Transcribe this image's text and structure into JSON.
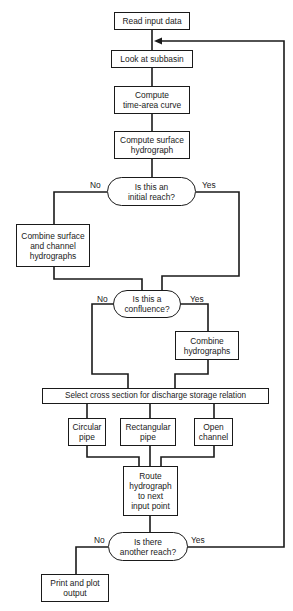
{
  "diagram": {
    "nodes": {
      "read_input": {
        "label": "Read input data"
      },
      "look_subbasin": {
        "label": "Look at subbasin"
      },
      "time_area": {
        "label": "Compute\ntime-area curve"
      },
      "surface_hydro": {
        "label": "Compute surface\nhydrograph"
      },
      "initial_reach": {
        "label": "Is this an\ninitial reach?"
      },
      "combine_surface_channel": {
        "label": "Combine surface\nand channel\nhydrographs"
      },
      "confluence": {
        "label": "Is this a\nconfluence?"
      },
      "combine_hydro": {
        "label": "Combine\nhydrographs"
      },
      "select_cross_section": {
        "label": "Select cross section for discharge storage relation"
      },
      "circular_pipe": {
        "label": "Circular\npipe"
      },
      "rectangular_pipe": {
        "label": "Rectangular\npipe"
      },
      "open_channel": {
        "label": "Open\nchannel"
      },
      "route_hydro": {
        "label": "Route\nhydrograph\nto next\ninput point"
      },
      "another_reach": {
        "label": "Is there\nanother reach?"
      },
      "print_plot": {
        "label": "Print and plot\noutput"
      }
    },
    "edge_labels": {
      "initial_no": "No",
      "initial_yes": "Yes",
      "confluence_no": "No",
      "confluence_yes": "Yes",
      "another_no": "No",
      "another_yes": "Yes"
    },
    "edges": [
      {
        "from": "read_input",
        "to": "look_subbasin"
      },
      {
        "from": "look_subbasin",
        "to": "time_area"
      },
      {
        "from": "time_area",
        "to": "surface_hydro"
      },
      {
        "from": "surface_hydro",
        "to": "initial_reach"
      },
      {
        "from": "initial_reach",
        "to": "combine_surface_channel",
        "label": "No"
      },
      {
        "from": "initial_reach",
        "to": "confluence",
        "label": "Yes"
      },
      {
        "from": "combine_surface_channel",
        "to": "confluence"
      },
      {
        "from": "confluence",
        "to": "select_cross_section",
        "label": "No"
      },
      {
        "from": "confluence",
        "to": "combine_hydro",
        "label": "Yes"
      },
      {
        "from": "combine_hydro",
        "to": "select_cross_section"
      },
      {
        "from": "select_cross_section",
        "to": "circular_pipe"
      },
      {
        "from": "select_cross_section",
        "to": "rectangular_pipe"
      },
      {
        "from": "select_cross_section",
        "to": "open_channel"
      },
      {
        "from": "circular_pipe",
        "to": "route_hydro"
      },
      {
        "from": "rectangular_pipe",
        "to": "route_hydro"
      },
      {
        "from": "open_channel",
        "to": "route_hydro"
      },
      {
        "from": "route_hydro",
        "to": "another_reach"
      },
      {
        "from": "another_reach",
        "to": "print_plot",
        "label": "No"
      },
      {
        "from": "another_reach",
        "to": "look_subbasin",
        "label": "Yes"
      }
    ]
  }
}
